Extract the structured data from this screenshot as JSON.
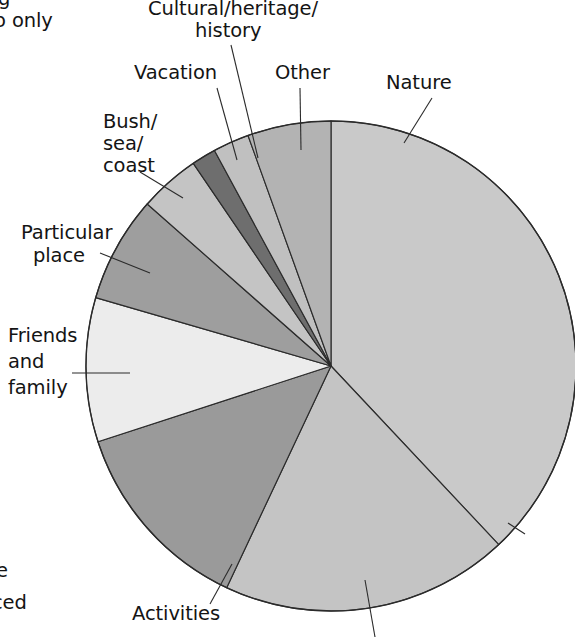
{
  "page": {
    "background_color": "#ffffff",
    "clipped_text_top_left_line1": "g",
    "clipped_text_top_left_line2": "o only",
    "clipped_text_bottom_left_line1": "e",
    "clipped_text_bottom_left_line2": "ced"
  },
  "chart_data": {
    "type": "pie",
    "title": "",
    "subtitle": "",
    "xlabel": "",
    "ylabel": "",
    "legend_position": "none",
    "grid": false,
    "labels_placement": "outside-with-leader-lines",
    "start_angle_deg": 0,
    "direction": "clockwise",
    "center": {
      "x": 331,
      "y": 366
    },
    "radius": 245,
    "categories": [
      "Nature",
      "Activities",
      "Friends and family",
      "Particular place",
      "Bush/sea/coast",
      "Vacation",
      "Cultural/heritage/history",
      "Other"
    ],
    "values": [
      38.0,
      19.0,
      13.0,
      9.5,
      7.0,
      4.0,
      1.6,
      2.4
    ],
    "unit": "percent",
    "slices": [
      {
        "label": "Nature",
        "value": 38.0,
        "color": "#c9c9c9",
        "start_deg": 0.0,
        "end_deg": 136.8
      },
      {
        "label": "Nature-lower",
        "value": 19.0,
        "color": "#c4c4c4",
        "start_deg": 136.8,
        "end_deg": 205.2
      },
      {
        "label": "Activities",
        "value": 13.0,
        "color": "#9a9a9a",
        "start_deg": 205.2,
        "end_deg": 252.0
      },
      {
        "label": "Friends and family",
        "value": 9.5,
        "color": "#ececec",
        "start_deg": 252.0,
        "end_deg": 286.2
      },
      {
        "label": "Particular place",
        "value": 7.0,
        "color": "#9e9e9e",
        "start_deg": 286.2,
        "end_deg": 311.4
      },
      {
        "label": "Bush/sea/coast",
        "value": 4.0,
        "color": "#c4c4c4",
        "start_deg": 311.4,
        "end_deg": 325.8
      },
      {
        "label": "Vacation",
        "value": 1.6,
        "color": "#6e6e6e",
        "start_deg": 325.8,
        "end_deg": 331.6
      },
      {
        "label": "Cultural/heritage/history",
        "value": 2.4,
        "color": "#c0c0c0",
        "start_deg": 331.6,
        "end_deg": 340.2
      },
      {
        "label": "Other",
        "value": 5.5,
        "color": "#b3b3b3",
        "start_deg": 340.2,
        "end_deg": 360.0
      }
    ]
  },
  "labels": {
    "cultural": {
      "line1": "Cultural/heritage/",
      "line2": "history"
    },
    "vacation": "Vacation",
    "other": "Other",
    "nature": "Nature",
    "bush": {
      "line1": "Bush/",
      "line2": "sea/",
      "line3": "coast"
    },
    "particular": {
      "line1": "Particular",
      "line2": "place"
    },
    "friends": {
      "line1": "Friends",
      "line2": "and",
      "line3": "family"
    },
    "activities": "Activities"
  }
}
